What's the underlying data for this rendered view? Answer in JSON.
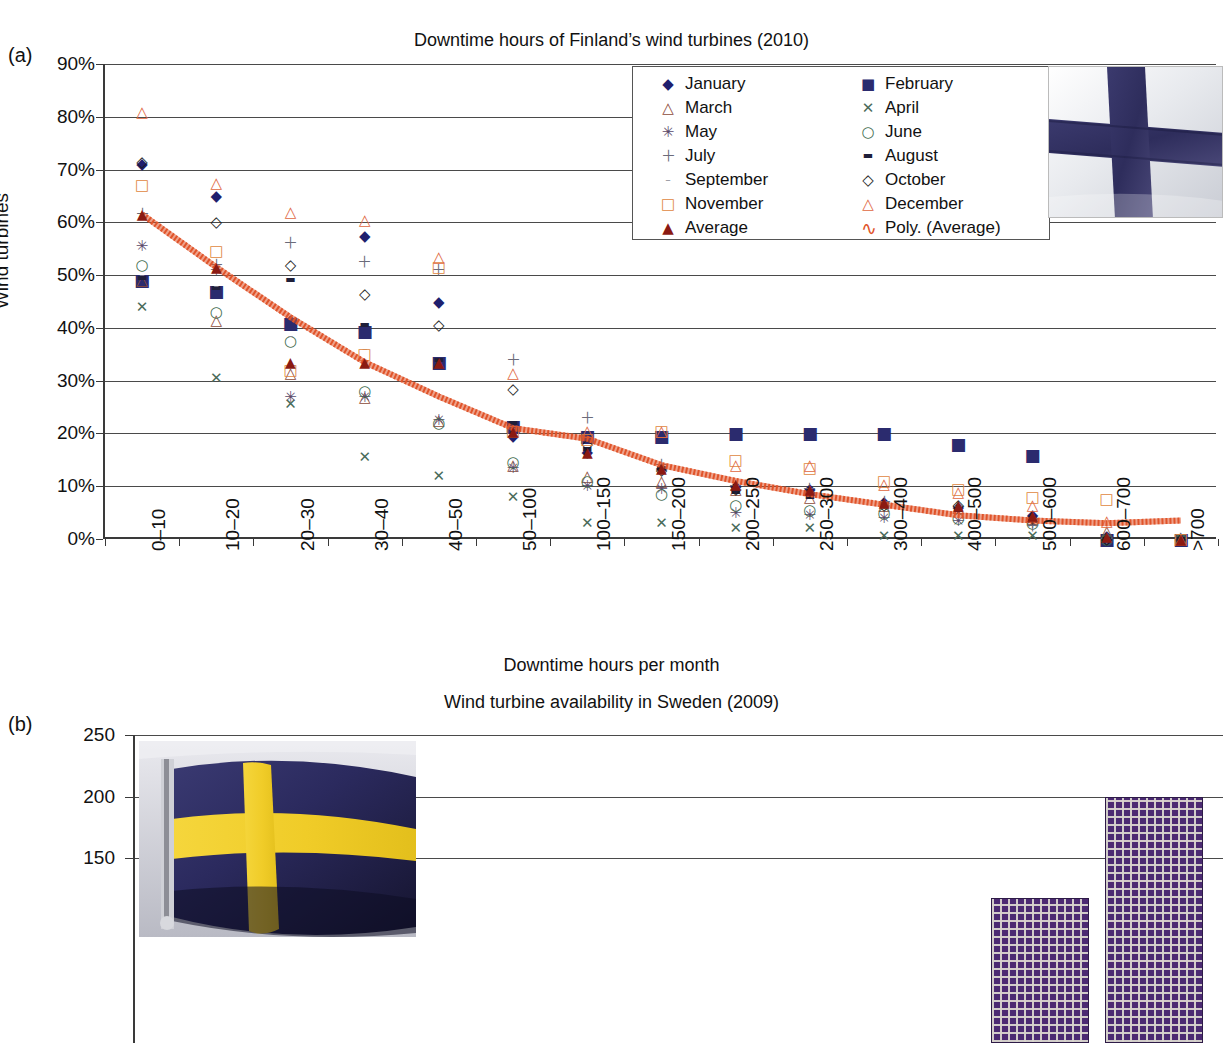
{
  "figure": {
    "panel_a_tag": "(a)",
    "panel_b_tag": "(b)"
  },
  "panel_a": {
    "title": "Downtime hours of Finland’s wind turbines (2010)",
    "xlabel": "Downtime hours per month",
    "ylabel": "Wind turbines",
    "flag_name": "finland-flag-photo",
    "legend": {
      "col1": [
        {
          "label": "January",
          "symbol": "◆",
          "color": "#1f1f6e",
          "name": "legend-january"
        },
        {
          "label": "March",
          "symbol": "△",
          "color": "#8d4b3a",
          "name": "legend-march"
        },
        {
          "label": "May",
          "symbol": "✳",
          "color": "#5a4a6a",
          "name": "legend-may"
        },
        {
          "label": "July",
          "symbol": "＋",
          "color": "#6b6b7a",
          "name": "legend-july"
        },
        {
          "label": "September",
          "symbol": "–",
          "color": "#8a8a95",
          "name": "legend-september"
        },
        {
          "label": "November",
          "symbol": "□",
          "color": "#e0883f",
          "name": "legend-november"
        },
        {
          "label": "Average",
          "symbol": "▲",
          "color": "#8b1a12",
          "name": "legend-average"
        }
      ],
      "col2": [
        {
          "label": "February",
          "symbol": "■",
          "color": "#2b2b6e",
          "name": "legend-february"
        },
        {
          "label": "April",
          "symbol": "✕",
          "color": "#4a6b5a",
          "name": "legend-april"
        },
        {
          "label": "June",
          "symbol": "○",
          "color": "#3e6b4e",
          "name": "legend-june"
        },
        {
          "label": "August",
          "symbol": "▬",
          "color": "#1f1f3a",
          "name": "legend-august"
        },
        {
          "label": "October",
          "symbol": "◇",
          "color": "#1a1a1a",
          "name": "legend-october"
        },
        {
          "label": "December",
          "symbol": "△",
          "color": "#e0673f",
          "name": "legend-december"
        },
        {
          "label": "Poly. (Average)",
          "symbol": "∿",
          "color": "#e0542a",
          "name": "legend-poly-average"
        }
      ]
    },
    "chart_data": {
      "type": "scatter",
      "title": "Downtime hours of Finland’s wind turbines (2010)",
      "xlabel": "Downtime hours per month",
      "ylabel": "Wind turbines",
      "ylim": [
        0,
        90
      ],
      "yticks": [
        "0%",
        "10%",
        "20%",
        "30%",
        "40%",
        "50%",
        "60%",
        "70%",
        "80%",
        "90%"
      ],
      "grid": true,
      "legend_position": "top-center",
      "categories": [
        "0–10",
        "10–20",
        "20–30",
        "30–40",
        "40–50",
        "50–100",
        "100–150",
        "150–200",
        "200–250",
        "250–300",
        "300–400",
        "400–500",
        "500–600",
        "600–700",
        ">700"
      ],
      "series": [
        {
          "name": "January",
          "symbol": "◆",
          "color": "#1f1f6e",
          "values": [
            71,
            65,
            41.5,
            57.5,
            45,
            19.5,
            16.5,
            13.5,
            10,
            9.5,
            7,
            6,
            4.5,
            0.5,
            0
          ]
        },
        {
          "name": "February",
          "symbol": "■",
          "color": "#2b2b6e",
          "values": [
            49,
            47,
            41,
            39.5,
            33.5,
            21.5,
            19.5,
            19.5,
            20,
            20,
            20,
            18,
            16,
            0,
            0
          ]
        },
        {
          "name": "March",
          "symbol": "△",
          "color": "#8d4b3a",
          "values": [
            49,
            41.5,
            31.5,
            27,
            22.5,
            14,
            12,
            11,
            9.5,
            8,
            6.5,
            6,
            4,
            1.5,
            0
          ]
        },
        {
          "name": "April",
          "symbol": "✕",
          "color": "#4a6b5a",
          "values": [
            44,
            30.5,
            25.5,
            15.5,
            12,
            8,
            3,
            3,
            2,
            2,
            0.5,
            0.5,
            0.5,
            0,
            0
          ]
        },
        {
          "name": "May",
          "symbol": "✳",
          "color": "#5a4a6a",
          "values": [
            55.5,
            51,
            27,
            27,
            22.5,
            13.5,
            10,
            9.5,
            5,
            4.5,
            4,
            3.5,
            3,
            0,
            0
          ]
        },
        {
          "name": "June",
          "symbol": "○",
          "color": "#3e6b4e",
          "values": [
            52,
            43,
            37.5,
            28,
            22,
            14.5,
            11,
            8.5,
            6.5,
            5.5,
            5,
            4,
            3,
            0,
            0
          ]
        },
        {
          "name": "July",
          "symbol": "＋",
          "color": "#6b6b7a",
          "values": [
            61.5,
            52,
            56,
            52.5,
            51,
            34,
            23,
            14,
            10,
            9.5,
            7,
            6,
            2.5,
            0,
            0
          ]
        },
        {
          "name": "August",
          "symbol": "▬",
          "color": "#1f1f3a",
          "values": [
            49.5,
            47.5,
            49,
            40.5,
            34,
            22,
            17,
            13.5,
            9,
            8,
            6.5,
            5.5,
            3.5,
            0,
            0
          ]
        },
        {
          "name": "September",
          "symbol": "–",
          "color": "#8a8a95",
          "values": [
            50,
            48,
            38.5,
            36,
            33,
            21,
            16,
            13,
            9.5,
            8.5,
            6.5,
            5.5,
            3.5,
            0,
            0
          ]
        },
        {
          "name": "October",
          "symbol": "◇",
          "color": "#1a1a1a",
          "values": [
            71.5,
            60,
            52,
            46.5,
            40.5,
            28.5,
            18,
            13,
            9.5,
            9,
            6.5,
            6.5,
            4,
            0,
            0
          ]
        },
        {
          "name": "November",
          "symbol": "□",
          "color": "#e0883f",
          "values": [
            67,
            54.5,
            32,
            35,
            51.5,
            20.5,
            19,
            20.5,
            15,
            13.5,
            11,
            9.5,
            8,
            7.5,
            0
          ]
        },
        {
          "name": "December",
          "symbol": "△",
          "color": "#e0673f",
          "values": [
            81,
            67.5,
            62,
            60.5,
            53.5,
            31.5,
            20.5,
            20.5,
            14,
            14,
            10.5,
            9,
            6.5,
            3.5,
            0
          ]
        },
        {
          "name": "Average",
          "symbol": "▲",
          "color": "#8b1a12",
          "values": [
            61.5,
            51.5,
            33.5,
            33.5,
            33.5,
            20.5,
            16.5,
            13.5,
            10.5,
            9.5,
            7,
            6.5,
            4.5,
            0.5,
            0
          ]
        }
      ],
      "trend": {
        "name": "Poly. (Average)",
        "type": "polynomial",
        "color": "#e0542a",
        "values": [
          61.5,
          51.5,
          42,
          33.5,
          27,
          21,
          19,
          14,
          11,
          8.5,
          6.5,
          4.5,
          3.5,
          3,
          3.5
        ]
      }
    }
  },
  "panel_b": {
    "title": "Wind turbine availability in Sweden (2009)",
    "ylabel": "of wind turbines",
    "flag_name": "sweden-flag-photo",
    "chart_data": {
      "type": "bar",
      "title": "Wind turbine availability in Sweden (2009)",
      "ylabel": "of wind turbines",
      "yticks": [
        250,
        200,
        150
      ],
      "ylim": [
        0,
        250
      ],
      "grid": true,
      "bars": [
        {
          "value": 200,
          "left_pct": 89.0,
          "width_pct": 9.0,
          "name": "bar-high"
        },
        {
          "value": 118,
          "left_pct": 78.5,
          "width_pct": 9.0,
          "name": "bar-second"
        }
      ]
    }
  }
}
